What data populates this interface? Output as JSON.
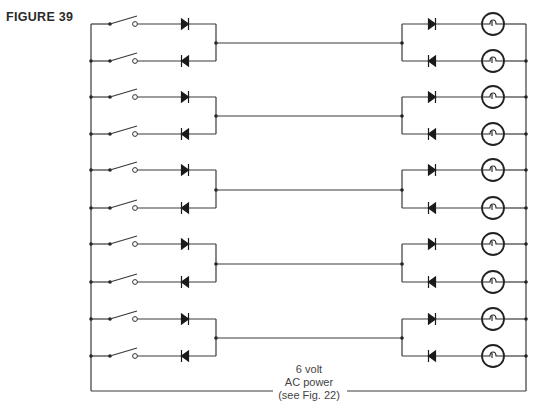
{
  "figure": {
    "label": "FIGURE 39"
  },
  "power_source": {
    "line1": "6 volt",
    "line2": "AC power",
    "line3": "(see Fig. 22)"
  },
  "diagram": {
    "type": "circuit-schematic",
    "left_bus_x": 91,
    "right_bus_x": 526,
    "bus_top_y": 24,
    "bus_bottom_y": 391,
    "bottom_wire_gap": [
      273,
      347
    ],
    "switch": {
      "pivot_x": 110,
      "contact_x": 135
    },
    "left_diode_x": 185,
    "left_junction_x": 216,
    "right_junction_x": 402,
    "right_diode_x": 432,
    "lamp_x": 493,
    "lamp_radius": 11,
    "channels": [
      {
        "id": 1,
        "top_y": 24,
        "bottom_y": 61,
        "mid_y": 43
      },
      {
        "id": 2,
        "top_y": 97,
        "bottom_y": 134,
        "mid_y": 116
      },
      {
        "id": 3,
        "top_y": 170,
        "bottom_y": 208,
        "mid_y": 190
      },
      {
        "id": 4,
        "top_y": 244,
        "bottom_y": 282,
        "mid_y": 264
      },
      {
        "id": 5,
        "top_y": 319,
        "bottom_y": 356,
        "mid_y": 338
      }
    ],
    "components": {
      "switches": 10,
      "diodes": 20,
      "lamps": 10,
      "interconnect_wires": 5
    }
  }
}
